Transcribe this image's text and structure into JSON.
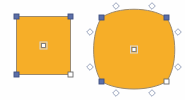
{
  "canvas": {
    "name": "vector-shape-canvas",
    "width": 185,
    "height": 100,
    "background_color": "#fefefe"
  },
  "palette": {
    "shape_fill": "#f6ae28",
    "shape_stroke": "#9c8a6e",
    "handle_selected_fill": "#5b6fa8",
    "handle_selected_stroke": "#3f4f80",
    "handle_anchor_fill": "#ffffff",
    "handle_anchor_stroke": "#6b6b6b",
    "handle_curve_fill": "#fdfdfd",
    "handle_curve_stroke": "#8e9bb5",
    "center_handle_fill": "#ffffff",
    "center_handle_stroke": "#7a7a7a",
    "center_handle_halo": "#d8d8d8"
  },
  "shapes": [
    {
      "id": "shape-square",
      "label": "Square",
      "type": "rectangle",
      "selected": true,
      "path": "M16.5,16.5 L70.5,16.5 L70.5,74.5 L16.5,74.5 Z",
      "center": {
        "x": 43.5,
        "y": 45.5
      },
      "handles": {
        "corners": [
          {
            "name": "handle-top-left",
            "x": 16.5,
            "y": 16.5,
            "state": "selected",
            "size": 5
          },
          {
            "name": "handle-top-right",
            "x": 70.5,
            "y": 16.5,
            "state": "selected",
            "size": 5
          },
          {
            "name": "handle-bottom-left",
            "x": 16.5,
            "y": 74.5,
            "state": "selected",
            "size": 5
          },
          {
            "name": "handle-bottom-right",
            "x": 70.5,
            "y": 74.5,
            "state": "anchor",
            "size": 5
          }
        ],
        "curve_points": [],
        "center": {
          "name": "handle-center",
          "x": 43.5,
          "y": 45.5,
          "size": 4
        }
      }
    },
    {
      "id": "shape-rounded-square",
      "label": "Rounded Square",
      "type": "bezier-blob",
      "selected": true,
      "path": "M101.5,17.5 C118,6.5 150,6.5 166.5,17.5 C177.5,34 177.5,66 166.5,81.5 C150,91.5 118,91.5 101.5,81.5 C91,66 91,34 101.5,17.5 Z",
      "center": {
        "x": 134,
        "y": 49.5
      },
      "handles": {
        "corners": [
          {
            "name": "handle-top-left",
            "x": 101.5,
            "y": 17.5,
            "state": "selected",
            "size": 5
          },
          {
            "name": "handle-top-right",
            "x": 166.5,
            "y": 17.5,
            "state": "selected",
            "size": 5
          },
          {
            "name": "handle-bottom-left",
            "x": 101.5,
            "y": 81.5,
            "state": "selected",
            "size": 5
          },
          {
            "name": "handle-bottom-right",
            "x": 166.5,
            "y": 81.5,
            "state": "anchor",
            "size": 5
          }
        ],
        "curve_points": [
          {
            "name": "curve-handle-top-left",
            "x": 116,
            "y": 6,
            "size": 4
          },
          {
            "name": "curve-handle-top-right",
            "x": 152,
            "y": 6,
            "size": 4
          },
          {
            "name": "curve-handle-right-top",
            "x": 178,
            "y": 32,
            "size": 4
          },
          {
            "name": "curve-handle-right-bottom",
            "x": 178,
            "y": 67,
            "size": 4
          },
          {
            "name": "curve-handle-bottom-right",
            "x": 152,
            "y": 93,
            "size": 4
          },
          {
            "name": "curve-handle-bottom-left",
            "x": 116,
            "y": 93,
            "size": 4
          },
          {
            "name": "curve-handle-left-bottom",
            "x": 90,
            "y": 67,
            "size": 4
          },
          {
            "name": "curve-handle-left-top",
            "x": 90,
            "y": 32,
            "size": 4
          }
        ],
        "center": {
          "name": "handle-center",
          "x": 134,
          "y": 49.5,
          "size": 4
        }
      }
    }
  ]
}
